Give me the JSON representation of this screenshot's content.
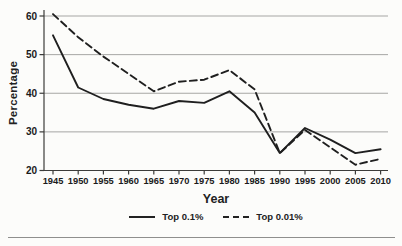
{
  "chart_data": {
    "type": "line",
    "title": "",
    "xlabel": "Year",
    "ylabel": "Percentage",
    "x": [
      1945,
      1950,
      1955,
      1960,
      1965,
      1970,
      1975,
      1980,
      1985,
      1990,
      1995,
      2000,
      2005,
      2010
    ],
    "series": [
      {
        "name": "Top 0.1%",
        "style": "solid",
        "values": [
          55,
          41.5,
          38.5,
          37,
          36,
          38,
          37.5,
          40.5,
          35,
          24.5,
          31,
          28,
          24.5,
          25.5
        ]
      },
      {
        "name": "Top 0.01%",
        "style": "dashed",
        "values": [
          60.5,
          54.5,
          49.5,
          45,
          40.5,
          43,
          43.5,
          46,
          41,
          24.5,
          30.5,
          26,
          21.5,
          23
        ]
      }
    ],
    "ylim": [
      20,
      60
    ],
    "yticks": [
      20,
      30,
      40,
      50,
      60
    ],
    "grid": true,
    "legend_position": "bottom",
    "colors": {
      "line": "#1f1f1f",
      "grid": "#a6a6a4",
      "axis": "#3c3c3a",
      "text": "#1a1a1a",
      "background": "#fcfcfa"
    }
  }
}
